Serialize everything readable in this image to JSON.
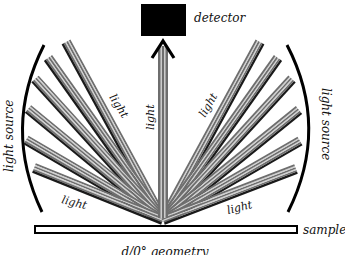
{
  "diagram": {
    "title": "d/0° geometry",
    "labels": {
      "detector": "detector",
      "sample": "sample",
      "light_source_left": "light source",
      "light_source_right": "light source",
      "light_vertical": "light",
      "light_upper_left": "light",
      "light_lower_left": "light",
      "light_upper_right": "light",
      "light_lower_right": "light"
    },
    "colors": {
      "detector": "#000000",
      "beam_dark": "#1a1a1a",
      "beam_gray": "#6e6e6e",
      "beam_light": "#d0d0d0",
      "arc": "#000000",
      "sample_border": "#000000",
      "text": "#111111"
    },
    "geometry": {
      "convergence_point": [
        163,
        220
      ],
      "left_beam_starts": [
        [
          66,
          42
        ],
        [
          48,
          58
        ],
        [
          35,
          79
        ],
        [
          28,
          109
        ],
        [
          26,
          140
        ],
        [
          34,
          168
        ]
      ],
      "right_beam_starts": [
        [
          260,
          42
        ],
        [
          278,
          58
        ],
        [
          292,
          79
        ],
        [
          299,
          110
        ],
        [
          300,
          141
        ],
        [
          296,
          169
        ]
      ],
      "vertical_beam": {
        "from": [
          163,
          215
        ],
        "to": [
          163,
          42
        ]
      }
    }
  }
}
